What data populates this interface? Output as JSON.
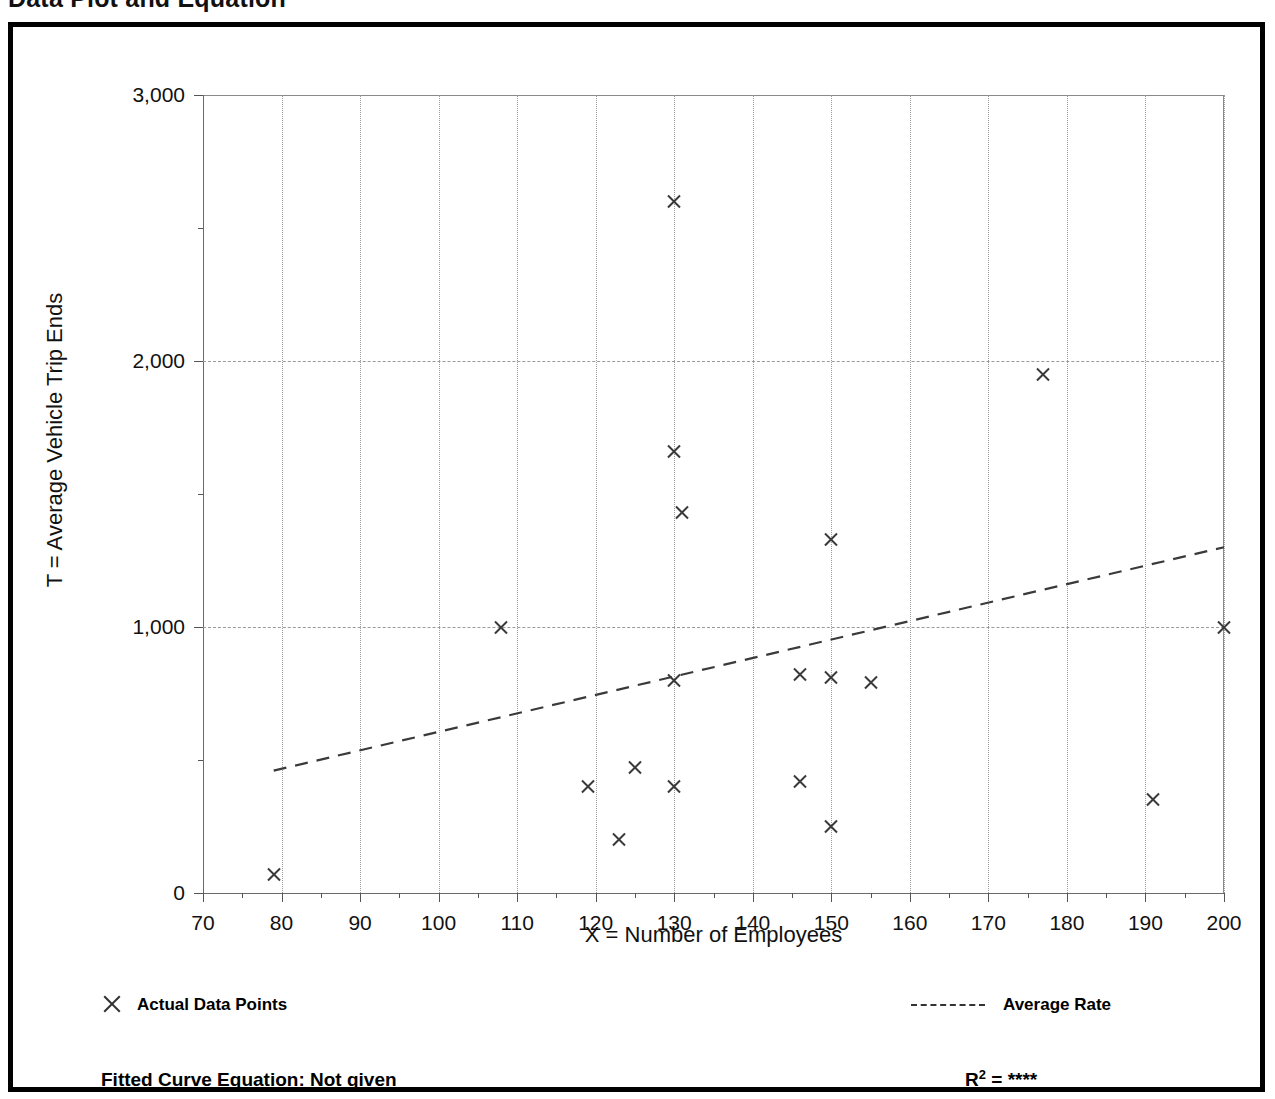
{
  "title": "Data Plot and Equation",
  "axes": {
    "x_title": "X = Number of Employees",
    "y_title": "T = Average Vehicle Trip Ends"
  },
  "legend": {
    "points_marker_icon": "x-marker-icon",
    "points_label": "Actual Data Points",
    "rate_line_icon": "dashed-line-icon",
    "rate_label": "Average Rate"
  },
  "footer": {
    "equation_label": "Fitted Curve Equation:  Not given",
    "r2_prefix": "R",
    "r2_exponent": "2",
    "r2_equals": " = ",
    "r2_value": "****"
  },
  "chart_data": {
    "type": "scatter",
    "title": "Data Plot and Equation",
    "xlabel": "X = Number of Employees",
    "ylabel": "T = Average Vehicle Trip Ends",
    "xlim": [
      70,
      200
    ],
    "ylim": [
      0,
      3000
    ],
    "xticks": [
      70,
      80,
      90,
      100,
      110,
      120,
      130,
      140,
      150,
      160,
      170,
      180,
      190,
      200
    ],
    "xticklabels": [
      "70",
      "80",
      "90",
      "100",
      "110",
      "120",
      "130",
      "140",
      "150",
      "160",
      "170",
      "180",
      "190",
      "200"
    ],
    "xminor_step": 5,
    "yticks": [
      0,
      1000,
      2000,
      3000
    ],
    "yticklabels": [
      "0",
      "1,000",
      "2,000",
      "3,000"
    ],
    "yminor_step": 500,
    "grid": "dotted vertical every 10, dashed horizontal at 1000 and 2000",
    "legend_position": "below-axes",
    "series": [
      {
        "name": "Actual Data Points",
        "marker": "x",
        "color": "#3a3a3a",
        "points": [
          [
            79,
            70
          ],
          [
            108,
            1000
          ],
          [
            119,
            400
          ],
          [
            123,
            200
          ],
          [
            125,
            470
          ],
          [
            130,
            2600
          ],
          [
            130,
            1660
          ],
          [
            130,
            800
          ],
          [
            130,
            400
          ],
          [
            131,
            1430
          ],
          [
            146,
            820
          ],
          [
            146,
            420
          ],
          [
            150,
            1330
          ],
          [
            150,
            810
          ],
          [
            150,
            250
          ],
          [
            155,
            790
          ],
          [
            177,
            1950
          ],
          [
            191,
            350
          ],
          [
            200,
            1000
          ]
        ]
      },
      {
        "name": "Average Rate",
        "type": "line",
        "style": "dashed",
        "color": "#3a3a3a",
        "x": [
          79,
          200
        ],
        "y": [
          460,
          1300
        ]
      }
    ]
  }
}
